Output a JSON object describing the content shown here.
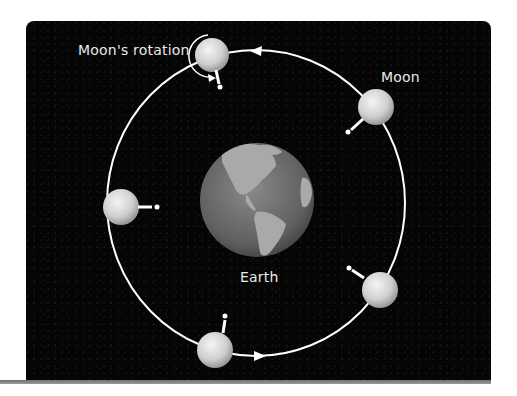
{
  "diagram": {
    "title": "",
    "labels": {
      "rotation": "Moon's rotation",
      "moon": "Moon",
      "earth": "Earth"
    },
    "colors": {
      "background": "#050505",
      "orbit": "#ffffff",
      "text": "#e9e9e9",
      "base_bar": "#8a8a8a"
    },
    "orbit": {
      "cx": 256,
      "cy": 203,
      "rx": 149,
      "ry": 153,
      "direction": "counterclockwise"
    },
    "earth": {
      "cx": 257,
      "cy": 200,
      "r": 57
    },
    "moons": [
      {
        "id": "top",
        "cx": 212,
        "cy": 55,
        "r": 17,
        "astronaut_dir": "down"
      },
      {
        "id": "upper-right",
        "cx": 376,
        "cy": 107,
        "r": 18,
        "astronaut_dir": "down-left"
      },
      {
        "id": "left",
        "cx": 121,
        "cy": 207,
        "r": 18,
        "astronaut_dir": "right"
      },
      {
        "id": "lower-right",
        "cx": 380,
        "cy": 290,
        "r": 18,
        "astronaut_dir": "up-left"
      },
      {
        "id": "bottom",
        "cx": 215,
        "cy": 350,
        "r": 18,
        "astronaut_dir": "up"
      }
    ],
    "arrows": [
      {
        "id": "top-arrow",
        "x": 258,
        "y": 51,
        "direction": "left"
      },
      {
        "id": "bottom-arrow",
        "x": 258,
        "y": 355,
        "direction": "right"
      }
    ]
  }
}
